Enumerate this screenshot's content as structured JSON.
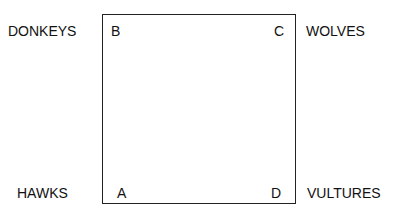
{
  "diagram": {
    "corners": {
      "top_left": {
        "letter": "B",
        "name": "DONKEYS"
      },
      "top_right": {
        "letter": "C",
        "name": "WOLVES"
      },
      "bottom_left": {
        "letter": "A",
        "name": "HAWKS"
      },
      "bottom_right": {
        "letter": "D",
        "name": "VULTURES"
      }
    },
    "colors": {
      "line": "#222222",
      "text": "#111111",
      "background": "#ffffff"
    }
  }
}
